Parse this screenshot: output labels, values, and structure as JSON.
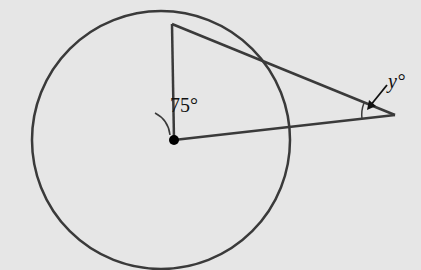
{
  "diagram": {
    "type": "circle-tangent-geometry",
    "labels": {
      "central_angle": "75°",
      "unknown_angle": "y°"
    },
    "colors": {
      "background": "#e6e6e6",
      "stroke": "#3a3a3a"
    },
    "elements": [
      "circle with center point",
      "radius to tangent point",
      "tangent line from external point",
      "secant line through center to external point",
      "angle arc 75° at center",
      "angle arc y° at external point with arrow"
    ]
  }
}
